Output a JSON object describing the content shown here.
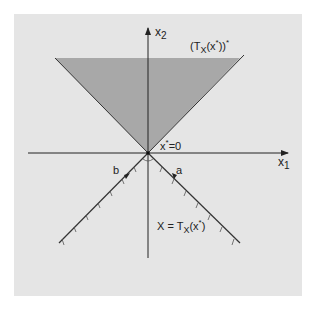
{
  "figure": {
    "axes": {
      "x_axis_label": "x1",
      "y_axis_label": "x2"
    },
    "labels": {
      "polar_cone": "(TX(x*))*",
      "origin": "x*=0",
      "vector_a": "a",
      "vector_b": "b",
      "feasible_set": "X = TX(x*)"
    },
    "colors": {
      "background": "#ffffff",
      "panel": "#e5e5e5",
      "shaded_cone": "#a8a8a8",
      "lines": "#333333"
    }
  }
}
